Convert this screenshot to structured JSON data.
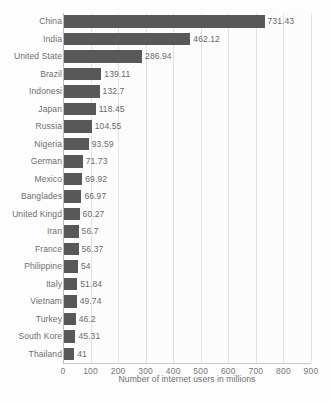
{
  "chart_data": {
    "type": "bar",
    "orientation": "horizontal",
    "title": "",
    "xlabel": "Number of internet users in millions",
    "ylabel": "",
    "xlim": [
      0,
      900
    ],
    "xticks": [
      0,
      100,
      200,
      300,
      400,
      500,
      600,
      700,
      800,
      900
    ],
    "grid": true,
    "legend": false,
    "bar_color": "#585859",
    "categories": [
      "China",
      "India",
      "United State",
      "Brazil",
      "Indonesi",
      "Japan",
      "Russia",
      "Nigeria",
      "German",
      "Mexico",
      "Banglades",
      "United Kingd",
      "Iran",
      "France",
      "Philippine",
      "Italy",
      "Vietnam",
      "Turkey",
      "South Kore",
      "Thailand"
    ],
    "values": [
      731.43,
      462.12,
      286.94,
      139.11,
      132.7,
      118.45,
      104.55,
      93.59,
      71.73,
      69.92,
      66.97,
      60.27,
      56.7,
      56.37,
      54,
      51.84,
      49.74,
      46.2,
      45.31,
      41
    ],
    "value_labels": [
      "731.43",
      "462.12",
      "286.94",
      "139.11",
      "132.7",
      "118.45",
      "104.55",
      "93.59",
      "71.73",
      "69.92",
      "66.97",
      "60.27",
      "56.7",
      "56.37",
      "54",
      "51.84",
      "49.74",
      "46.2",
      "45.31",
      "41"
    ],
    "xtick_labels": [
      "0",
      "100",
      "200",
      "300",
      "400",
      "500",
      "600",
      "700",
      "800",
      "900"
    ]
  }
}
